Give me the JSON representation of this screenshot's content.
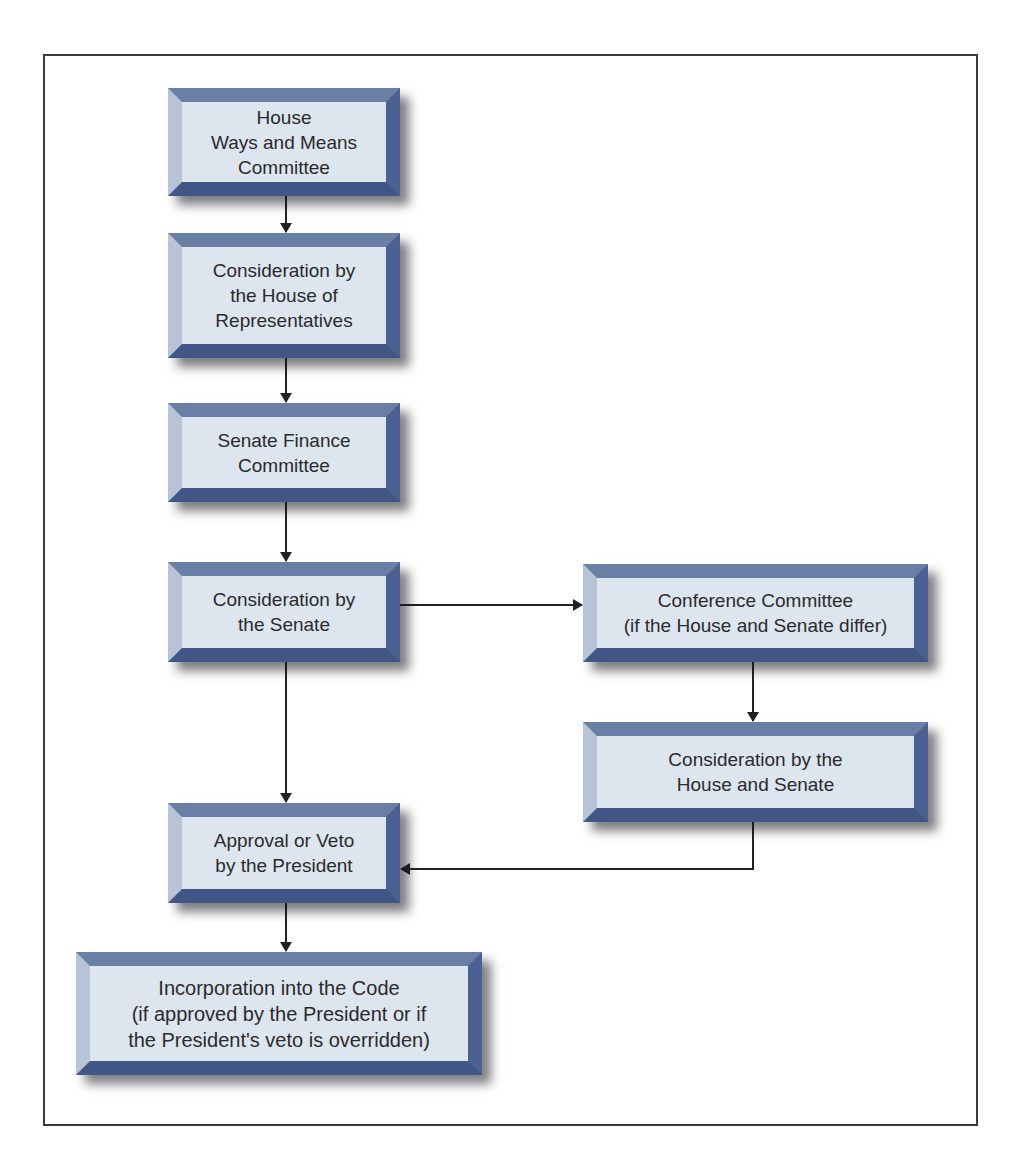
{
  "diagram": {
    "type": "flowchart",
    "title": "",
    "colors": {
      "frame_border": "#3a3a3a",
      "box_face": "#dde5ef",
      "bevel_top": "#6a7fa6",
      "bevel_left": "#b7c4d8",
      "bevel_right": "#4a6191",
      "bevel_bottom": "#3f5687",
      "text": "#2b2b2b",
      "arrow": "#222222"
    },
    "nodes": [
      {
        "id": "ways_and_means",
        "label": "House\nWays and Means\nCommittee"
      },
      {
        "id": "house_consideration",
        "label": "Consideration by\nthe House of\nRepresentatives"
      },
      {
        "id": "senate_finance",
        "label": "Senate Finance\nCommittee"
      },
      {
        "id": "senate_consideration",
        "label": "Consideration by\nthe Senate"
      },
      {
        "id": "conference_committee",
        "label": "Conference Committee\n(if the House and Senate differ)"
      },
      {
        "id": "house_and_senate",
        "label": "Consideration by the\nHouse and Senate"
      },
      {
        "id": "president",
        "label": "Approval or Veto\nby the President"
      },
      {
        "id": "incorporation",
        "label": "Incorporation into the Code\n(if approved by the President or if\nthe President's veto is overridden)"
      }
    ],
    "edges": [
      {
        "from": "ways_and_means",
        "to": "house_consideration"
      },
      {
        "from": "house_consideration",
        "to": "senate_finance"
      },
      {
        "from": "senate_finance",
        "to": "senate_consideration"
      },
      {
        "from": "senate_consideration",
        "to": "conference_committee"
      },
      {
        "from": "senate_consideration",
        "to": "president"
      },
      {
        "from": "conference_committee",
        "to": "house_and_senate"
      },
      {
        "from": "house_and_senate",
        "to": "president"
      },
      {
        "from": "president",
        "to": "incorporation"
      }
    ]
  }
}
